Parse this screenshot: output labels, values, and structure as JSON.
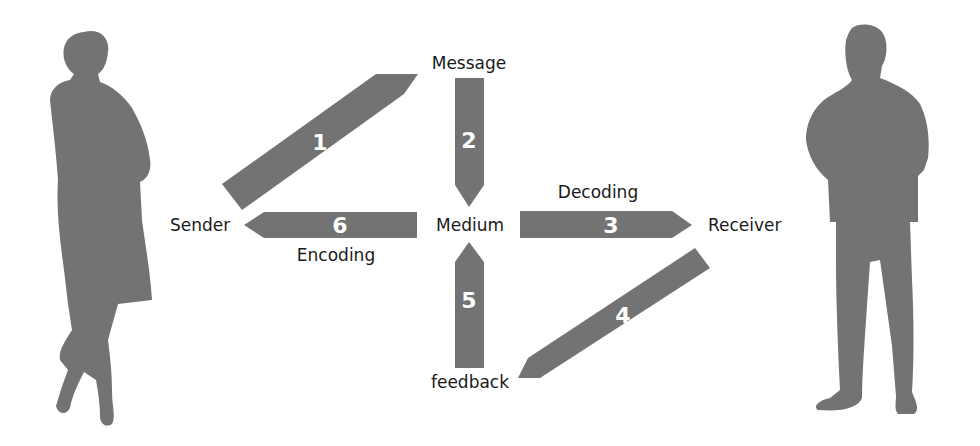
{
  "diagram": {
    "colors": {
      "shape": "#737373",
      "label": "#1a1a1a",
      "number": "#ffffff",
      "background": "#ffffff"
    },
    "nodes": {
      "sender": "Sender",
      "message": "Message",
      "medium": "Medium",
      "receiver": "Receiver",
      "feedback": "feedback"
    },
    "edge_labels": {
      "decoding": "Decoding",
      "encoding": "Encoding"
    },
    "arrows": [
      {
        "number": "1",
        "from": "Sender",
        "to": "Message"
      },
      {
        "number": "2",
        "from": "Message",
        "to": "Medium"
      },
      {
        "number": "3",
        "from": "Medium",
        "to": "Receiver"
      },
      {
        "number": "4",
        "from": "Receiver",
        "to": "feedback"
      },
      {
        "number": "5",
        "from": "feedback",
        "to": "Medium"
      },
      {
        "number": "6",
        "from": "Medium",
        "to": "Sender"
      }
    ],
    "figures": {
      "left": "woman-silhouette",
      "right": "man-silhouette"
    }
  }
}
